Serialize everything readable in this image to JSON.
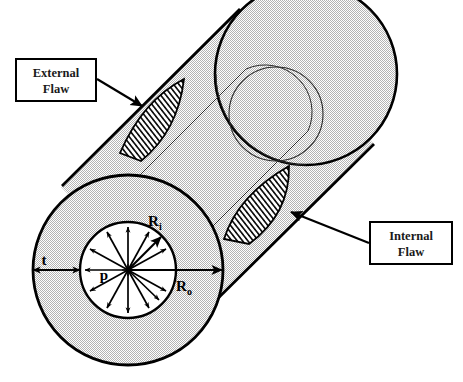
{
  "figure": {
    "type": "engineering-cross-section-diagram"
  },
  "callouts": [
    {
      "id": "external-flaw",
      "line1": "External",
      "line2": "Flaw",
      "box": {
        "x": 16,
        "y": 59,
        "w": 80,
        "h": 42
      },
      "leader_from": {
        "x": 96,
        "y": 80
      },
      "leader_to": {
        "x": 140,
        "y": 105
      }
    },
    {
      "id": "internal-flaw",
      "line1": "Internal",
      "line2": "Flaw",
      "box": {
        "x": 370,
        "y": 222,
        "w": 82,
        "h": 42
      },
      "leader_from": {
        "x": 370,
        "y": 243
      },
      "leader_to": {
        "x": 288,
        "y": 212
      }
    }
  ],
  "dimensions": [
    {
      "id": "wall-thickness",
      "symbol": "t",
      "subscript": ""
    },
    {
      "id": "inner-radius",
      "symbol": "R",
      "subscript": "i"
    },
    {
      "id": "outer-radius",
      "symbol": "R",
      "subscript": "o"
    },
    {
      "id": "internal-pressure",
      "symbol": "p",
      "subscript": ""
    }
  ],
  "labels": {
    "t": "t",
    "p": "p",
    "R": "R",
    "sub_i": "i",
    "sub_o": "o"
  },
  "geometry": {
    "near_end": {
      "cx": 128,
      "cy": 270,
      "r_outer": 95,
      "r_inner": 48
    },
    "far_end": {
      "cx": 306,
      "cy": 74,
      "r_outer": 91,
      "r_inner": 47,
      "bore_cx": 276,
      "bore_cy": 114
    },
    "pressure_arrow_count": 12
  },
  "colors": {
    "body_fill": "#d6d6d6",
    "outline": "#000000",
    "hatch": "#000000",
    "background": "#ffffff",
    "bore_fill": "#ffffff"
  }
}
